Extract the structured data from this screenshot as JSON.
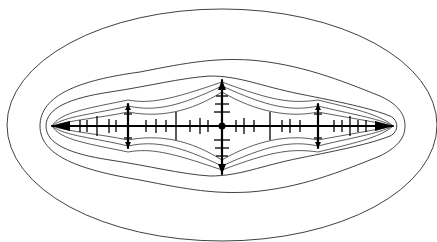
{
  "figure": {
    "background": "#ffffff",
    "line_color": "#2a2a2a",
    "set_color": "#000000",
    "center": [
      222,
      126
    ],
    "set_extent_x": [
      52,
      393
    ],
    "set_main_spike_y": [
      80,
      174
    ],
    "equipotentials": [
      {
        "level": 1,
        "rx": 215,
        "ry": 116
      },
      {
        "level": 2,
        "x_extent": [
          40,
          405
        ]
      },
      {
        "level": 3,
        "x_extent": [
          46,
          399
        ]
      }
    ],
    "major_spikes_x": [
      128,
      222,
      318
    ],
    "minor_spikes_x": [
      97,
      176,
      270,
      350
    ]
  }
}
